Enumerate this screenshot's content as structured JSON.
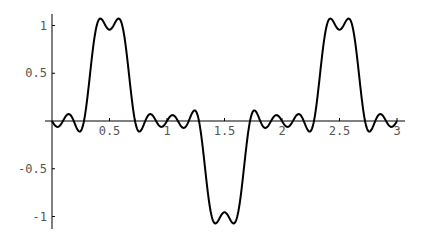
{
  "chart_data": {
    "type": "line",
    "title": "",
    "xlabel": "",
    "ylabel": "",
    "xlim": [
      0,
      3
    ],
    "ylim": [
      -1.1,
      1.1
    ],
    "grid": false,
    "legend": null,
    "x_ticks": [
      0.5,
      1,
      1.5,
      2,
      2.5,
      3
    ],
    "x_tick_labels": [
      "0.5",
      "1",
      "1.5",
      "2",
      "2.5",
      "3"
    ],
    "y_ticks": [
      1,
      0.5,
      -0.5,
      -1
    ],
    "y_tick_labels": [
      "1",
      "0.5",
      "-0.5",
      "-1"
    ],
    "series": [
      {
        "name": "fourier-partial-sum",
        "color": "#000000",
        "harmonics": 9,
        "x": [
          0,
          0.1,
          0.2,
          0.3,
          0.4,
          0.45,
          0.5,
          0.55,
          0.6,
          0.7,
          0.8,
          0.9,
          1.0,
          1.1,
          1.2,
          1.3,
          1.4,
          1.45,
          1.5,
          1.55,
          1.6,
          1.7,
          1.8,
          1.9,
          2.0,
          2.1,
          2.2,
          2.3,
          2.4,
          2.45,
          2.5,
          2.55,
          2.6,
          2.7,
          2.8,
          2.9,
          3.0
        ],
        "y": [
          0,
          -0.05,
          0.05,
          0.45,
          1.05,
          1.08,
          0.97,
          1.08,
          1.05,
          0.45,
          0.05,
          -0.05,
          0,
          0.05,
          -0.05,
          -0.45,
          -1.05,
          -1.08,
          -0.97,
          -1.08,
          -1.05,
          -0.45,
          -0.05,
          0.05,
          0,
          -0.05,
          0.05,
          0.45,
          1.05,
          1.08,
          0.97,
          1.08,
          1.05,
          0.45,
          0.05,
          -0.05,
          0
        ]
      }
    ]
  }
}
